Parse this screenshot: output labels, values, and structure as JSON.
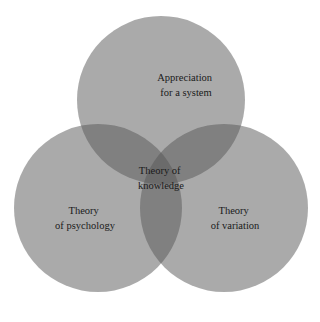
{
  "diagram": {
    "type": "venn",
    "sets": [
      {
        "id": "system",
        "label_lines": [
          "Appreciation",
          "for a system"
        ]
      },
      {
        "id": "psychology",
        "label_lines": [
          "Theory",
          "of psychology"
        ]
      },
      {
        "id": "variation",
        "label_lines": [
          "Theory",
          "of variation"
        ]
      }
    ],
    "center": {
      "label_lines": [
        "Theory of",
        "knowledge"
      ]
    },
    "colors": {
      "circle_fill": "#555555",
      "background": "#ffffff",
      "text": "#1a1a1a"
    }
  }
}
